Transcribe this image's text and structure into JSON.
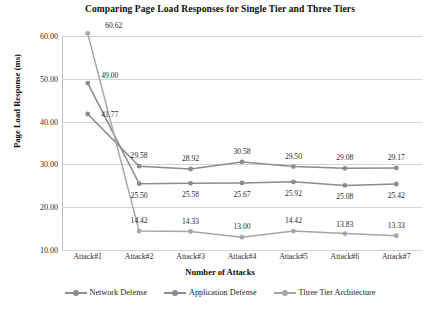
{
  "chart_data": {
    "type": "line",
    "title": "Comparing Page Load Responses for Single Tier and Three Tiers",
    "xlabel": "Number  of Attacks",
    "ylabel": "Page Load Response (ms)",
    "categories": [
      "Attack#1",
      "Attack#2",
      "Attack#3",
      "Attack#4",
      "Attack#5",
      "Attack#6",
      "Attack#7"
    ],
    "ylim": [
      10.0,
      60.0
    ],
    "yticks": [
      "10.00",
      "20.00",
      "30.00",
      "40.00",
      "50.00",
      "60.00"
    ],
    "ytick_values": [
      10,
      20,
      30,
      40,
      50,
      60
    ],
    "grid": true,
    "legend_position": "bottom",
    "series": [
      {
        "name": "Network Defense",
        "color": "#8c8c8c",
        "values": [
          41.77,
          29.58,
          28.92,
          30.58,
          29.5,
          29.08,
          29.17
        ],
        "labels": [
          "41.77",
          "29.58",
          "28.92",
          "30.58",
          "29.50",
          "29.08",
          "29.17"
        ]
      },
      {
        "name": "Application Defense",
        "color": "#8c8c8c",
        "values": [
          49.0,
          25.5,
          25.58,
          25.67,
          25.92,
          25.08,
          25.42
        ],
        "labels": [
          "49.00",
          "25.50",
          "25.58",
          "25.67",
          "25.92",
          "25.08",
          "25.42"
        ]
      },
      {
        "name": "Three Tier Architecture",
        "color": "#a6a6a6",
        "values": [
          60.62,
          14.42,
          14.33,
          13.0,
          14.42,
          13.83,
          13.33
        ],
        "labels": [
          "60.62",
          "14.42",
          "14.33",
          "13.00",
          "14.42",
          "13.83",
          "13.33"
        ]
      }
    ]
  },
  "legend": {
    "items": [
      {
        "label": "Network Defense"
      },
      {
        "label": "Application Defense"
      },
      {
        "label": "Three Tier Architecture"
      }
    ]
  }
}
